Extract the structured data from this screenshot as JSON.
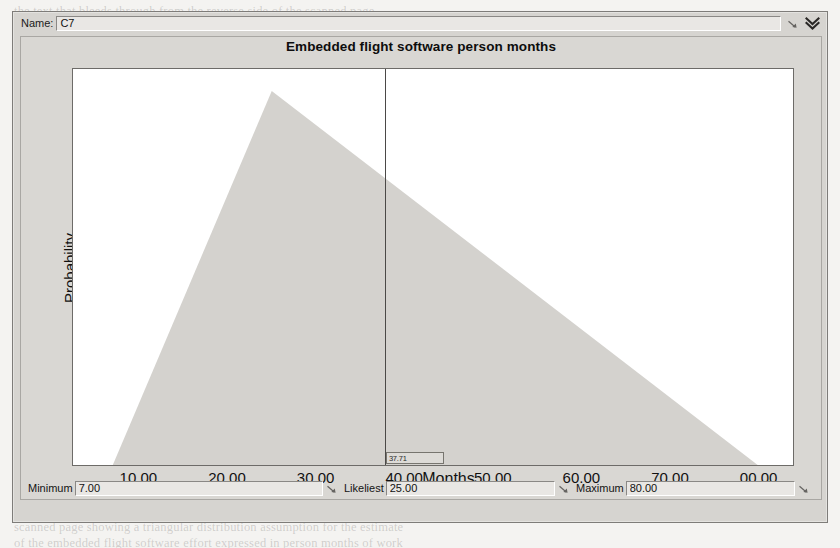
{
  "window": {
    "name_label": "Name:",
    "name_value": "C7",
    "resize_grip_icon": "resize-grip-icon",
    "expand_icon": "double-chevron-down-icon"
  },
  "chart": {
    "title": "Embedded flight software person months",
    "y_axis_label": "Probability",
    "x_axis_label": "Months",
    "marker_value": "37.71"
  },
  "parameters": [
    {
      "label": "Minimum",
      "value": "7.00",
      "name": "minimum"
    },
    {
      "label": "Likeliest",
      "value": "25.00",
      "name": "likeliest"
    },
    {
      "label": "Maximum",
      "value": "80.00",
      "name": "maximum"
    }
  ],
  "page_bleed": {
    "top": "the text that bleeds through from the reverse side of the scanned page",
    "line1": "scanned page showing a triangular distribution assumption for the estimate",
    "line2": "of the embedded flight software effort expressed in person months of work"
  },
  "chart_data": {
    "type": "area",
    "title": "Embedded flight software person months",
    "xlabel": "Months",
    "ylabel": "Probability",
    "distribution": "triangular",
    "minimum": 7.0,
    "likeliest": 25.0,
    "maximum": 80.0,
    "xlim": [
      2.5,
      84.0
    ],
    "ylim": [
      0,
      1
    ],
    "grid": false,
    "legend": null,
    "x_tick_labels": [
      "10.00",
      "20.00",
      "30.00",
      "40.00",
      "50.00",
      "60.00",
      "70.00",
      "00.00"
    ],
    "x_tick_values": [
      10,
      20,
      30,
      40,
      50,
      60,
      70,
      80
    ],
    "y_tick_labels": [],
    "marker": {
      "x": 37.71,
      "label": "37.71",
      "style": "vertical-line"
    },
    "vertices": [
      {
        "x": 7.0,
        "y": 0.0
      },
      {
        "x": 25.0,
        "y": 1.0
      },
      {
        "x": 80.0,
        "y": 0.0
      }
    ],
    "fill_color": "#d4d2ce",
    "line_color": "#4b4947"
  }
}
